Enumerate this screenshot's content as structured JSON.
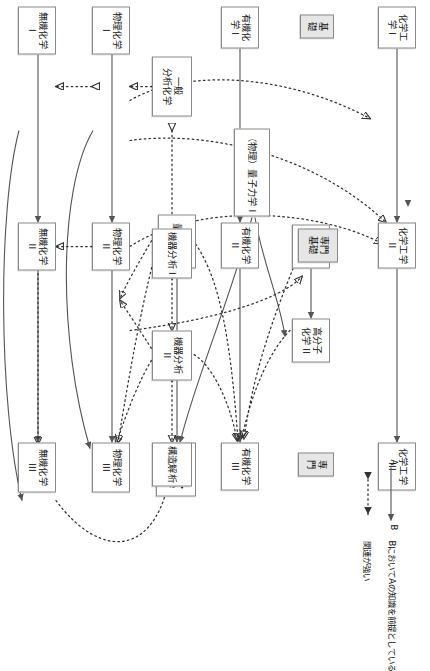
{
  "diagram": {
    "categories": [
      {
        "id": "cat-kiso",
        "label": "基礎"
      },
      {
        "id": "cat-senkiso",
        "label": "専門\n基礎"
      },
      {
        "id": "cat-senmon",
        "label": "専門"
      }
    ],
    "nodes": [
      {
        "id": "kagakukogaku1",
        "label": "化学工学 I"
      },
      {
        "id": "kagakukogaku2",
        "label": "化学工学 II"
      },
      {
        "id": "kagakukogaku3",
        "label": "化学工学 III"
      },
      {
        "id": "kobunshi1",
        "label": "高分子\n化学 I"
      },
      {
        "id": "kobunshi2",
        "label": "高分子\n化学 II"
      },
      {
        "id": "butsuri-ryoushi",
        "label": "（物理）量子力学 I"
      },
      {
        "id": "yuki1",
        "label": "有機化学 I"
      },
      {
        "id": "yuki2",
        "label": "有機化学 II"
      },
      {
        "id": "yuki3",
        "label": "有機化学 III"
      },
      {
        "id": "ryoushikagaku",
        "label": "量子化学"
      },
      {
        "id": "rironkeisan",
        "label": "理論化学・\n計算化学"
      },
      {
        "id": "ippanbunseki",
        "label": "一般\n分析化学"
      },
      {
        "id": "kikibunseki1",
        "label": "機器分析 I"
      },
      {
        "id": "kikibunseki2",
        "label": "機器分析 II"
      },
      {
        "id": "kouzoukaiseki",
        "label": "構造解析"
      },
      {
        "id": "butsurikagaku1",
        "label": "物理化学 I"
      },
      {
        "id": "butsurikagaku2",
        "label": "物理化学 II"
      },
      {
        "id": "butsurikagaku3",
        "label": "物理化学 III"
      },
      {
        "id": "mukikagaku1",
        "label": "無機化学 I"
      },
      {
        "id": "mukikagaku2",
        "label": "無機化学 II"
      },
      {
        "id": "mukikagaku3",
        "label": "無機化学 III"
      }
    ],
    "legend": {
      "solid_from": "A",
      "solid_to": "B",
      "solid_desc": "BにおいてAの知識を前提としている",
      "dotted_desc": "関連が強い"
    },
    "colors": {
      "box_border": "#8a8a8a",
      "category_fill": "#e6e6e6",
      "solid_arrow": "#555555",
      "dotted_arrow": "#333333",
      "background": "#ffffff"
    }
  }
}
